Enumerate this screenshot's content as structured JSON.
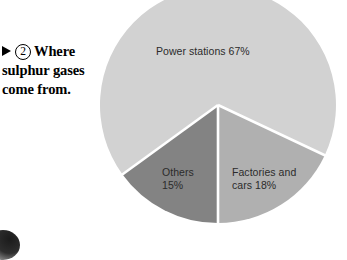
{
  "caption": {
    "marker_icon": "triangle-right-icon",
    "number": "2",
    "line1": "Where",
    "line2": "sulphur gases",
    "line3": "come from."
  },
  "chart_data": {
    "type": "pie",
    "title": "Where sulphur gases come from.",
    "categories": [
      "Power stations",
      "Factories and cars",
      "Others"
    ],
    "values": [
      67,
      18,
      15
    ],
    "unit": "%",
    "labels": [
      "Power stations 67%",
      "Factories and cars 18%",
      "Others 15%"
    ],
    "label_lines": {
      "power": [
        "Power stations 67%"
      ],
      "factories": [
        "Factories and cars",
        "cars 18%"
      ],
      "others": [
        "Others",
        "15%"
      ]
    },
    "slice_labels": {
      "power_stations": "Power stations 67%",
      "factories_line1": "Factories and",
      "factories_line2": "cars 18%",
      "others_line1": "Others",
      "others_line2": "15%"
    },
    "colors": {
      "power_stations": "#d2d2d2",
      "factories_and_cars": "#b0b0b0",
      "others": "#838383",
      "separator": "#ffffff",
      "label_text": "#2b2b2b",
      "background": "#ffffff"
    },
    "legend": "none",
    "grid": false,
    "start_angle_deg": 180,
    "direction": "counter-clockwise"
  }
}
